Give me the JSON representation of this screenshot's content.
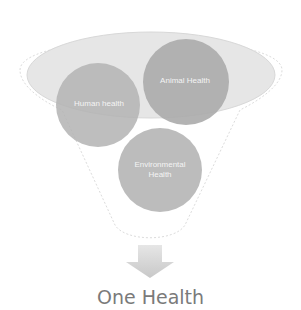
{
  "diagram": {
    "type": "funnel-venn",
    "inputs": [
      {
        "label": "Human health"
      },
      {
        "label": "Animal Health"
      },
      {
        "label": "Environmental Health"
      }
    ],
    "output": {
      "label": "One Health"
    },
    "colors": {
      "funnel_outline": "#d8d8d8",
      "rim_fill": "#e4e4e4",
      "circle_fill": "#b5b5b5",
      "arrow": "#d0d0d0",
      "title_text": "#7a7a7a",
      "circle_text": "#f4f4f4"
    }
  }
}
